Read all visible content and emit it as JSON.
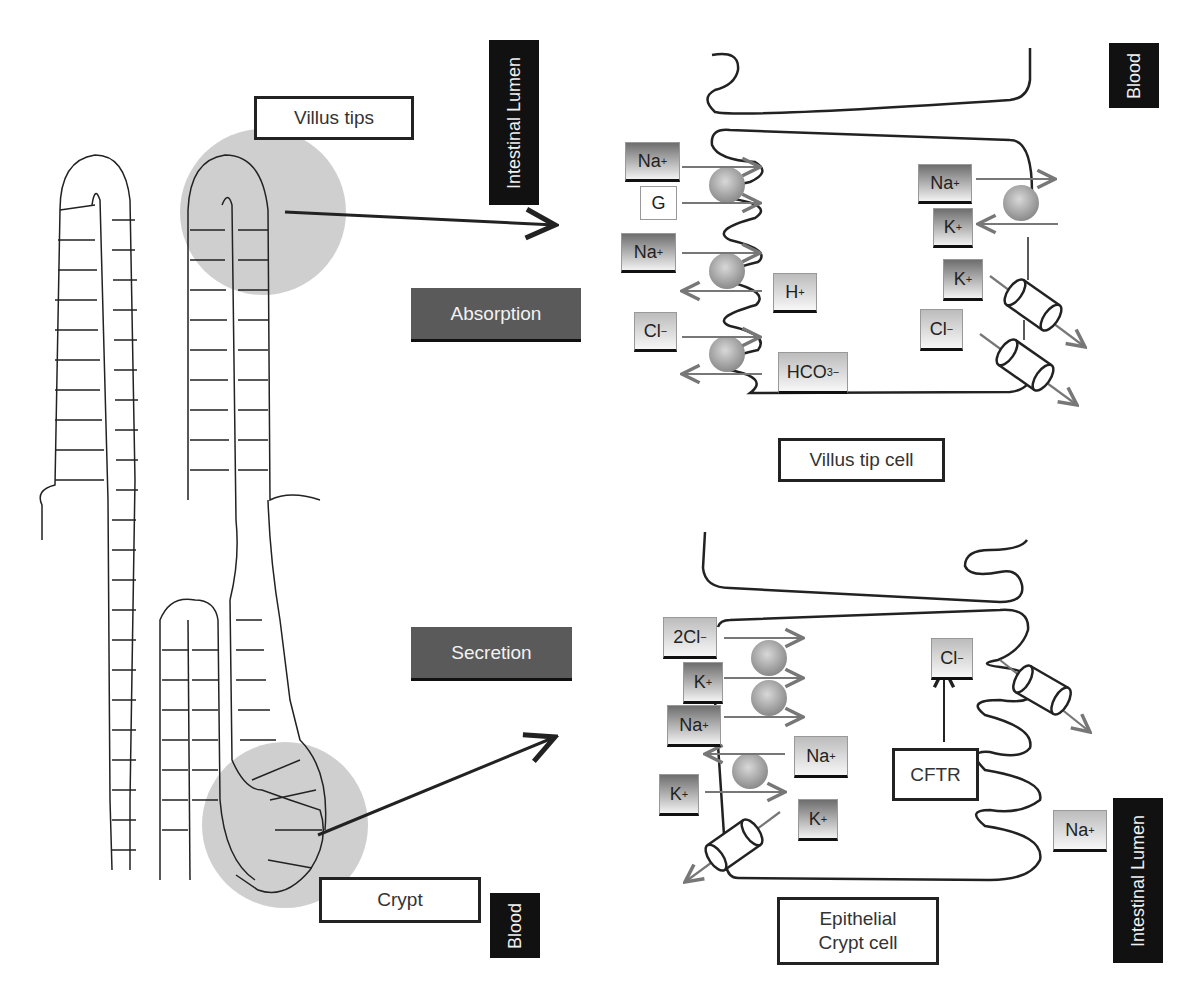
{
  "figure": {
    "left_panel": {
      "villus_tips_label": "Villus tips",
      "crypt_label": "Crypt",
      "highlight_color": "#cfcfcf"
    },
    "process_labels": {
      "absorption": "Absorption",
      "secretion": "Secretion"
    },
    "compartment_labels": {
      "top_left": "Intestinal Lumen",
      "top_right": "Blood",
      "bottom_left": "Blood",
      "bottom_right": "Intestinal Lumen"
    },
    "villus_tip_cell": {
      "caption": "Villus tip cell",
      "apical_ions": [
        {
          "base": "Na",
          "sup": "+",
          "style": "dark"
        },
        {
          "base": "G",
          "sup": "",
          "style": "plain"
        },
        {
          "base": "Na",
          "sup": "+",
          "style": "dark"
        },
        {
          "base": "H",
          "sup": "+",
          "style": "light"
        },
        {
          "base": "Cl",
          "sup": "−",
          "style": "light"
        },
        {
          "base": "HCO",
          "sub": "3",
          "sup": "−",
          "style": "light"
        }
      ],
      "basolateral_ions": [
        {
          "base": "Na",
          "sup": "+",
          "style": "dark"
        },
        {
          "base": "K",
          "sup": "+",
          "style": "dark"
        },
        {
          "base": "K",
          "sup": "+",
          "style": "dark"
        },
        {
          "base": "Cl",
          "sup": "−",
          "style": "light"
        }
      ]
    },
    "crypt_cell": {
      "caption_line1": "Epithelial",
      "caption_line2": "Crypt cell",
      "basolateral_ions": [
        {
          "base": "2Cl",
          "sup": "−",
          "style": "light"
        },
        {
          "base": "K",
          "sup": "+",
          "style": "dark"
        },
        {
          "base": "Na",
          "sup": "+",
          "style": "dark"
        },
        {
          "base": "Na",
          "sup": "+",
          "style": "light"
        },
        {
          "base": "K",
          "sup": "+",
          "style": "dark"
        },
        {
          "base": "K",
          "sup": "+",
          "style": "dark"
        }
      ],
      "apical_ions": [
        {
          "base": "Cl",
          "sup": "−",
          "style": "light"
        },
        {
          "base": "Na",
          "sup": "+",
          "style": "light"
        }
      ],
      "channel_label": "CFTR"
    }
  }
}
